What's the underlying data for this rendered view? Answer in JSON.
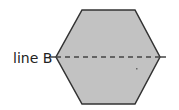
{
  "diagram": {
    "shape": "hexagon",
    "fill_color": "#c2c2c2",
    "stroke_color": "#333333",
    "line": {
      "label": "line B",
      "style": "dashed",
      "orientation": "horizontal"
    }
  }
}
